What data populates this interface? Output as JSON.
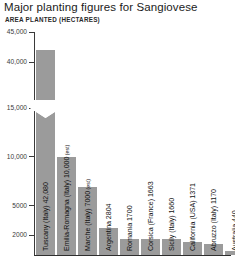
{
  "chart_data": {
    "type": "bar",
    "title": "Major planting figures for Sangiovese",
    "subtitle": "AREA PLANTED (HECTARES)",
    "xlabel": "",
    "ylabel": "AREA PLANTED (HECTARES)",
    "grid": false,
    "legend": "none",
    "axis_break": {
      "present": true,
      "below": 15000,
      "above": 40000,
      "note": "y-axis broken between 15,000 and 40,000"
    },
    "ytick_labels": [
      "45,000",
      "40,000",
      "15,000",
      "10,000",
      "5000",
      "2000"
    ],
    "ytick_values": [
      45000,
      40000,
      15000,
      10000,
      5000,
      2000
    ],
    "ylim": [
      0,
      45000
    ],
    "categories": [
      "Tuscany (Italy)",
      "Emilia-Romagna (Italy)",
      "Marche (Italy)",
      "Argentina",
      "Romania",
      "Corsica (France)",
      "Sicily (Italy)",
      "California (USA)",
      "Abruzzo (Italy)",
      "Australia"
    ],
    "values": [
      42080,
      10000,
      7000,
      2804,
      1700,
      1663,
      1660,
      1371,
      1170,
      440
    ],
    "bars": [
      {
        "label": "Tuscany (Italy) 42,080",
        "name": "Tuscany (Italy)",
        "value": 42080,
        "value_text": "42,080",
        "estimated": false,
        "est_text": ""
      },
      {
        "label": "Emilia-Romagna (Italy) 10,000",
        "name": "Emilia-Romagna (Italy)",
        "value": 10000,
        "value_text": "10,000",
        "estimated": true,
        "est_text": "(est)"
      },
      {
        "label": "Marche (Italy) 7000",
        "name": "Marche (Italy)",
        "value": 7000,
        "value_text": "7000",
        "estimated": true,
        "est_text": "(est)"
      },
      {
        "label": "Argentina 2804",
        "name": "Argentina",
        "value": 2804,
        "value_text": "2804",
        "estimated": false,
        "est_text": ""
      },
      {
        "label": "Romania 1700",
        "name": "Romania",
        "value": 1700,
        "value_text": "1700",
        "estimated": false,
        "est_text": ""
      },
      {
        "label": "Corsica (France) 1663",
        "name": "Corsica (France)",
        "value": 1663,
        "value_text": "1663",
        "estimated": false,
        "est_text": ""
      },
      {
        "label": "Sicily (Italy) 1660",
        "name": "Sicily (Italy)",
        "value": 1660,
        "value_text": "1660",
        "estimated": false,
        "est_text": ""
      },
      {
        "label": "California (USA) 1371",
        "name": "California (USA)",
        "value": 1371,
        "value_text": "1371",
        "estimated": false,
        "est_text": ""
      },
      {
        "label": "Abruzzo (Italy) 1170",
        "name": "Abruzzo (Italy)",
        "value": 1170,
        "value_text": "1170",
        "estimated": false,
        "est_text": ""
      },
      {
        "label": "Australia 440",
        "name": "Australia",
        "value": 440,
        "value_text": "440",
        "estimated": false,
        "est_text": ""
      }
    ],
    "colors": {
      "bar": "#9b9b9b",
      "axis": "#2e2e2e",
      "text": "#1a1a1a",
      "background": "#ffffff"
    }
  }
}
